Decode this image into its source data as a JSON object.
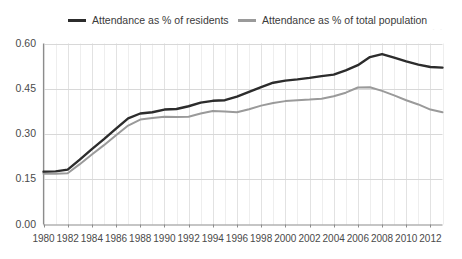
{
  "chart_data": {
    "type": "line",
    "title": "",
    "subtitle": "",
    "xlabel": "",
    "ylabel": "",
    "grid": true,
    "legend_position": "top",
    "xlim": [
      1980,
      2013
    ],
    "ylim": [
      0.0,
      0.6
    ],
    "ytick_labels": [
      "0.00",
      "0.15",
      "0.30",
      "0.45",
      "0.60"
    ],
    "ytick_values": [
      0.0,
      0.15,
      0.3,
      0.45,
      0.6
    ],
    "xtick_labels": [
      "1980",
      "1982",
      "1984",
      "1986",
      "1988",
      "1990",
      "1992",
      "1994",
      "1996",
      "1998",
      "2000",
      "2002",
      "2004",
      "2006",
      "2008",
      "2010",
      "2012"
    ],
    "xtick_values": [
      1980,
      1982,
      1984,
      1986,
      1988,
      1990,
      1992,
      1994,
      1996,
      1998,
      2000,
      2002,
      2004,
      2006,
      2008,
      2010,
      2012
    ],
    "x": [
      1980,
      1981,
      1982,
      1983,
      1984,
      1985,
      1986,
      1987,
      1988,
      1989,
      1990,
      1991,
      1992,
      1993,
      1994,
      1995,
      1996,
      1997,
      1998,
      1999,
      2000,
      2001,
      2002,
      2003,
      2004,
      2005,
      2006,
      2007,
      2008,
      2009,
      2010,
      2011,
      2012,
      2013
    ],
    "series": [
      {
        "name": "Attendance as % of residents",
        "color": "#2c2c2c",
        "line_width": 2.4,
        "values": [
          0.175,
          0.176,
          0.182,
          0.215,
          0.25,
          0.283,
          0.318,
          0.352,
          0.368,
          0.372,
          0.381,
          0.383,
          0.392,
          0.404,
          0.41,
          0.412,
          0.424,
          0.44,
          0.455,
          0.47,
          0.477,
          0.481,
          0.486,
          0.492,
          0.497,
          0.511,
          0.528,
          0.555,
          0.565,
          0.553,
          0.541,
          0.53,
          0.522,
          0.52
        ]
      },
      {
        "name": "Attendance as % of total population",
        "color": "#9a9a9a",
        "line_width": 2.0,
        "values": [
          0.168,
          0.168,
          0.17,
          0.2,
          0.232,
          0.263,
          0.296,
          0.328,
          0.348,
          0.353,
          0.357,
          0.356,
          0.357,
          0.368,
          0.376,
          0.375,
          0.372,
          0.382,
          0.394,
          0.403,
          0.409,
          0.412,
          0.414,
          0.417,
          0.425,
          0.437,
          0.454,
          0.455,
          0.443,
          0.428,
          0.412,
          0.398,
          0.381,
          0.372
        ]
      }
    ]
  },
  "legend": {
    "items": [
      {
        "label": "Attendance as % of residents"
      },
      {
        "label": "Attendance as % of total population"
      }
    ],
    "artifact": "· ·"
  },
  "axes": {
    "axis_color": "#8c8c8c",
    "grid_color": "#d8d8d8",
    "minor_grid_color": "#eeeeee",
    "tick_text_color": "#4a4a4a"
  }
}
